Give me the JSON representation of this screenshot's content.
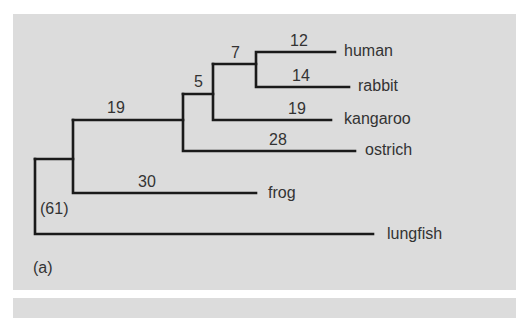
{
  "figure": {
    "panel_label": "(a)",
    "background": "#dcdcdc",
    "line_color": "#1a1a1a",
    "text_color": "#333333"
  },
  "tree": {
    "taxa": [
      {
        "name": "human",
        "branch_length": "12"
      },
      {
        "name": "rabbit",
        "branch_length": "14"
      },
      {
        "name": "kangaroo",
        "branch_length": "19"
      },
      {
        "name": "ostrich",
        "branch_length": "28"
      },
      {
        "name": "frog",
        "branch_length": "30"
      },
      {
        "name": "lungfish",
        "branch_length": "(61)"
      }
    ],
    "internal_branches": [
      {
        "label": "7",
        "description": "human+rabbit ancestor"
      },
      {
        "label": "5",
        "description": "mammal ancestor"
      },
      {
        "label": "19",
        "description": "amniote ancestor"
      }
    ]
  }
}
